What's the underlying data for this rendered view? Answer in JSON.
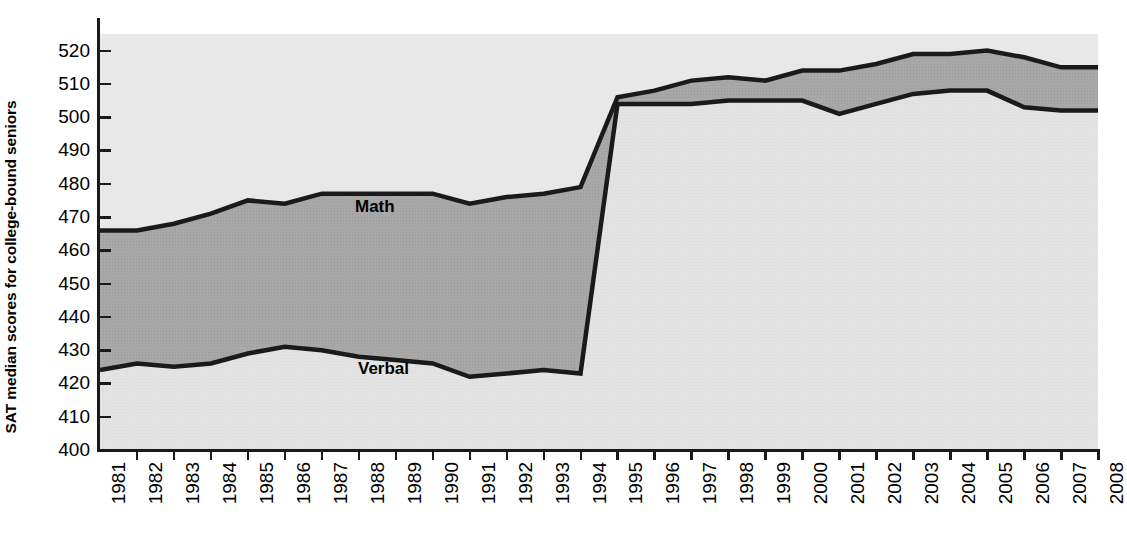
{
  "axis": {
    "y_title": "SAT median scores for college-bound seniors",
    "y_ticks": [
      "520",
      "510",
      "500",
      "490",
      "480",
      "470",
      "460",
      "450",
      "440",
      "430",
      "420",
      "410",
      "400"
    ]
  },
  "labels": {
    "math": "Math",
    "verbal": "Verbal"
  },
  "colors": {
    "math_band": "#a8a8a8",
    "verbal_band": "#e2e2e2",
    "line": "#1a1a1a",
    "plot_bg": "#e8e8e8"
  },
  "chart_data": {
    "type": "area",
    "title": "",
    "subtitle": "",
    "xlabel": "",
    "ylabel": "SAT median scores for college-bound seniors",
    "ylim": [
      400,
      525
    ],
    "xlim": [
      "1981",
      "2008"
    ],
    "grid": false,
    "legend": "inline annotations on bands",
    "note": "Scores were recentered beginning in 1995, producing the discontinuity between 1994 and 1995.",
    "x": [
      "1981",
      "1982",
      "1983",
      "1984",
      "1985",
      "1986",
      "1987",
      "1988",
      "1989",
      "1990",
      "1991",
      "1992",
      "1993",
      "1994",
      "1995",
      "1996",
      "1997",
      "1998",
      "1999",
      "2000",
      "2001",
      "2002",
      "2003",
      "2004",
      "2005",
      "2006",
      "2007",
      "2008"
    ],
    "series": [
      {
        "name": "Math",
        "values": [
          466,
          466,
          468,
          471,
          475,
          474,
          477,
          477,
          477,
          477,
          474,
          476,
          477,
          479,
          506,
          508,
          511,
          512,
          511,
          514,
          514,
          516,
          519,
          519,
          520,
          518,
          515,
          515
        ]
      },
      {
        "name": "Verbal",
        "values": [
          424,
          426,
          425,
          426,
          429,
          431,
          430,
          428,
          427,
          426,
          422,
          423,
          424,
          423,
          504,
          504,
          504,
          505,
          505,
          505,
          501,
          504,
          507,
          508,
          508,
          503,
          502,
          502
        ]
      }
    ]
  }
}
